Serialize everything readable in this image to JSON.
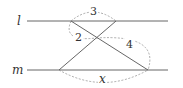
{
  "diagram": {
    "lines": {
      "l": {
        "label": "l"
      },
      "m": {
        "label": "m"
      }
    },
    "segments": [
      {
        "name": "transversal-1",
        "from": "A",
        "to": "D"
      },
      {
        "name": "transversal-2",
        "from": "B",
        "to": "C"
      }
    ],
    "measurements": {
      "top": "3",
      "upper_left": "2",
      "lower_right": "4",
      "bottom": "x"
    },
    "colors": {
      "solid_line": "#555555",
      "dashed_arc": "#888888",
      "text": "#333333"
    }
  }
}
